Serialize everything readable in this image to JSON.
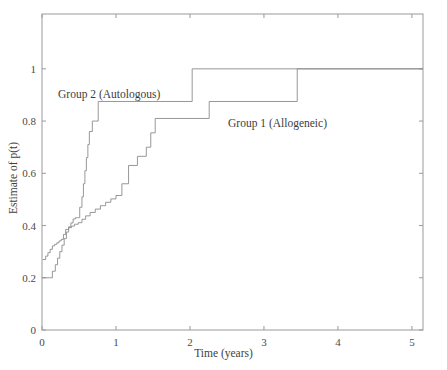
{
  "figure": {
    "background_color": "#ffffff",
    "line_color": "#8c8c8c",
    "axis_color": "#9a9a9a",
    "text_color": "#3d3d3d"
  },
  "chart_data": {
    "type": "line",
    "subtype": "step",
    "title": "",
    "xlabel": "Time (years)",
    "ylabel": "Estimate of p(t)",
    "xlim": [
      0,
      5.15
    ],
    "ylim": [
      0,
      1.21
    ],
    "xticks": [
      0,
      1,
      2,
      3,
      4,
      5
    ],
    "xticklabels": [
      "0",
      "1",
      "2",
      "3",
      "4",
      "5"
    ],
    "yticks": [
      0,
      0.2,
      0.4,
      0.6,
      0.8,
      1
    ],
    "yticklabels": [
      "0",
      "0.2",
      "0.4",
      "0.6",
      "0.8",
      "1"
    ],
    "grid": false,
    "legend_position": "inline-annotations",
    "annotations": [
      {
        "text": "Group 2 (Autologous)",
        "x": 0.31,
        "y": 0.93
      },
      {
        "text": "Group 1 (Allogeneic)",
        "x": 3.55,
        "y": 0.82
      }
    ],
    "series": [
      {
        "name": "Group 1 (Allogeneic)",
        "label": "Group 1 (Allogeneic)",
        "x": [
          0.01,
          0.05,
          0.08,
          0.11,
          0.14,
          0.17,
          0.2,
          0.23,
          0.26,
          0.29,
          0.32,
          0.36,
          0.4,
          0.44,
          0.49,
          0.54,
          0.59,
          0.65,
          0.72,
          0.79,
          0.86,
          0.93,
          1.0,
          1.08,
          1.17,
          1.23,
          1.29,
          1.35,
          1.41,
          1.47,
          1.53,
          2.26,
          3.45,
          5.15
        ],
        "y": [
          0.27,
          0.283,
          0.296,
          0.309,
          0.322,
          0.328,
          0.334,
          0.341,
          0.347,
          0.366,
          0.385,
          0.392,
          0.398,
          0.405,
          0.411,
          0.424,
          0.437,
          0.45,
          0.463,
          0.476,
          0.489,
          0.502,
          0.515,
          0.56,
          0.63,
          0.63,
          0.665,
          0.665,
          0.7,
          0.755,
          0.81,
          0.875,
          1.0,
          1.0
        ]
      },
      {
        "name": "Group 2 (Autologous)",
        "label": "Group 2 (Autologous)",
        "x": [
          0.0,
          0.1,
          0.14,
          0.18,
          0.21,
          0.24,
          0.27,
          0.3,
          0.33,
          0.36,
          0.39,
          0.42,
          0.45,
          0.48,
          0.51,
          0.54,
          0.56,
          0.58,
          0.6,
          0.62,
          0.64,
          0.68,
          0.72,
          0.76,
          2.03,
          5.15
        ],
        "y": [
          0.2,
          0.2,
          0.225,
          0.25,
          0.275,
          0.3,
          0.325,
          0.35,
          0.375,
          0.395,
          0.41,
          0.425,
          0.43,
          0.43,
          0.47,
          0.51,
          0.56,
          0.61,
          0.66,
          0.71,
          0.76,
          0.8,
          0.8,
          0.875,
          1.0,
          1.0
        ]
      }
    ]
  }
}
